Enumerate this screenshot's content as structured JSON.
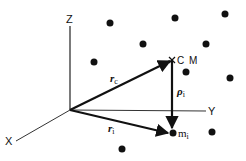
{
  "diagram": {
    "type": "vector-diagram",
    "axes": {
      "z_label": "Z",
      "y_label": "Y",
      "x_label": "X"
    },
    "points": {
      "center_of_mass": {
        "label": "C M",
        "marker": "x"
      },
      "particle": {
        "label_main": "m",
        "label_sub": "i"
      }
    },
    "vectors": [
      {
        "id": "r_c",
        "label_main": "r",
        "label_sub": "c",
        "from": "origin",
        "to": "center_of_mass"
      },
      {
        "id": "r_i",
        "label_main": "r",
        "label_sub": "i",
        "from": "origin",
        "to": "particle"
      },
      {
        "id": "rho_i",
        "label_main": "ρ",
        "label_sub": "i",
        "from": "center_of_mass",
        "to": "particle"
      }
    ],
    "background_particle_count": 10,
    "colors": {
      "ink": "#111111",
      "background": "#ffffff"
    }
  }
}
